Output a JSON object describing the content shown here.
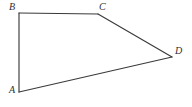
{
  "figure": {
    "kind": "geometry-diagram",
    "shape_name": "quadrilateral",
    "background_color": "#ffffff",
    "stroke_color": "#3a3a3a",
    "stroke_width": 1.15,
    "label_color": "#2f2f2f",
    "canvas": {
      "width": 192,
      "height": 107
    },
    "vertices": [
      {
        "id": "A",
        "label": "A",
        "x": 19,
        "y": 92,
        "label_x": 9,
        "label_y": 85
      },
      {
        "id": "B",
        "label": "B",
        "x": 19,
        "y": 13,
        "label_x": 9,
        "label_y": 2
      },
      {
        "id": "C",
        "label": "C",
        "x": 98,
        "y": 14,
        "label_x": 99,
        "label_y": 2
      },
      {
        "id": "D",
        "label": "D",
        "x": 172,
        "y": 57,
        "label_x": 175,
        "label_y": 46
      }
    ],
    "edges": [
      {
        "id": "AB",
        "from": "A",
        "to": "B",
        "path": "M 19 92 L 19 13"
      },
      {
        "id": "BC",
        "from": "B",
        "to": "C",
        "path": "M 19 13 L 98 14"
      },
      {
        "id": "CD",
        "from": "C",
        "to": "D",
        "path": "M 98 14 L 172 57"
      },
      {
        "id": "DA",
        "from": "D",
        "to": "A",
        "path": "M 172 57 L 19 92"
      }
    ]
  }
}
